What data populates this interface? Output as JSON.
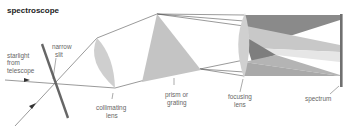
{
  "title": "spectroscope",
  "labels": {
    "starlight": [
      "starlight",
      "from",
      "telescope"
    ],
    "narrow_slit": [
      "narrow",
      "slit"
    ],
    "collimating_lens": [
      "collimating",
      "lens"
    ],
    "prism": [
      "prism or",
      "grating"
    ],
    "focusing_lens": [
      "focusing",
      "lens"
    ],
    "spectrum": "spectrum"
  },
  "colors": {
    "lens": "#cfcfcf",
    "prism": "#c4c4c4",
    "slit": "#666666",
    "spectrum_bar": "#707070",
    "ray": "#555555",
    "band_dark": "#7a7a7a",
    "band_mid": "#a8a8a8",
    "band_light": "#dcdcdc"
  }
}
